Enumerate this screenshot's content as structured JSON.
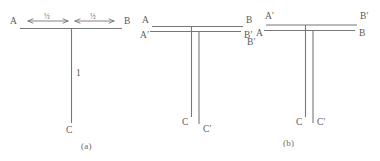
{
  "figure": {
    "background_color": "#ffffff",
    "stroke_color": "#777777",
    "text_color": "#5a5a5a",
    "panels": [
      {
        "id": "panel-a",
        "caption": "(a)",
        "labels": {
          "left_end": "A",
          "right_end": "B",
          "bottom_end": "C",
          "stem_length": "1",
          "segment_left": "½",
          "segment_right": "½"
        },
        "description": "T-shape with horizontal bar A to B and vertical stem down to C"
      },
      {
        "id": "panel-middle",
        "caption": "",
        "labels": {
          "top_left": "A",
          "top_right": "B",
          "bottom_left_of_bar": "A′",
          "bottom_right_of_bar": "B′",
          "stem_left": "C",
          "stem_right": "C′"
        },
        "description": "Two overlapping T-shapes, primed bar below unprimed bar"
      },
      {
        "id": "panel-b",
        "caption": "(b)",
        "labels": {
          "top_left": "A′",
          "below_left": "A",
          "far_left": "B′",
          "top_right": "B′",
          "below_right": "B",
          "stem_left": "C",
          "stem_right": "C′"
        },
        "description": "Two overlapping T-shapes, primed bar above unprimed bar"
      }
    ]
  }
}
